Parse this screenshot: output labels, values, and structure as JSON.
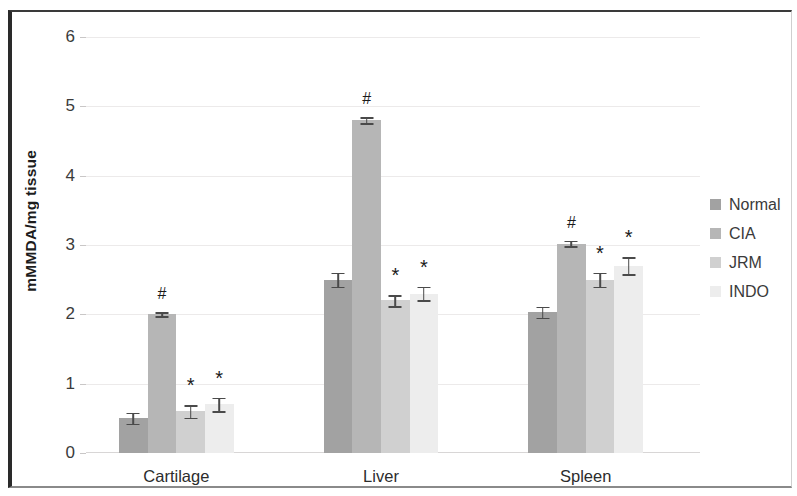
{
  "chart_data": {
    "type": "bar",
    "title": "",
    "xlabel": "",
    "ylabel": "mMMDA/mg tissue",
    "ylim": [
      0,
      6
    ],
    "yticks": [
      0,
      1,
      2,
      3,
      4,
      5,
      6
    ],
    "ytick_labels": [
      "0",
      "1",
      "2",
      "3",
      "4",
      "5",
      "6"
    ],
    "grid": true,
    "legend_position": "right",
    "categories": [
      "Cartilage",
      "Liver",
      "Spleen"
    ],
    "series": [
      {
        "name": "Normal",
        "color": "#a2a2a2",
        "values": [
          0.5,
          2.5,
          2.03
        ],
        "errors": [
          0.08,
          0.1,
          0.08
        ],
        "markers": [
          "",
          "",
          ""
        ]
      },
      {
        "name": "CIA",
        "color": "#b6b6b6",
        "values": [
          2.0,
          4.8,
          3.02
        ],
        "errors": [
          0.03,
          0.04,
          0.04
        ],
        "markers": [
          "#",
          "#",
          "#"
        ]
      },
      {
        "name": "JRM",
        "color": "#d0d0d0",
        "values": [
          0.6,
          2.2,
          2.5
        ],
        "errors": [
          0.09,
          0.08,
          0.1
        ],
        "markers": [
          "*",
          "*",
          "*"
        ]
      },
      {
        "name": "INDO",
        "color": "#ededed",
        "values": [
          0.7,
          2.3,
          2.7
        ],
        "errors": [
          0.1,
          0.1,
          0.12
        ],
        "markers": [
          "*",
          "*",
          "*"
        ]
      }
    ],
    "annotations": {
      "hash_meaning": "#",
      "star_meaning": "*"
    }
  },
  "legend": {
    "items": [
      {
        "label": "Normal",
        "color": "#a2a2a2"
      },
      {
        "label": "CIA",
        "color": "#b6b6b6"
      },
      {
        "label": "JRM",
        "color": "#d0d0d0"
      },
      {
        "label": "INDO",
        "color": "#ededed"
      }
    ]
  }
}
